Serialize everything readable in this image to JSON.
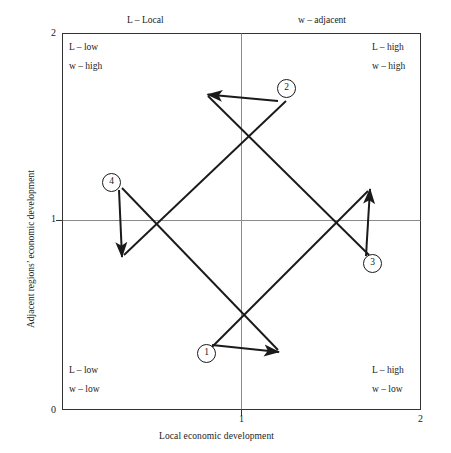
{
  "figure": {
    "axes": {
      "x_title": "Local economic development",
      "y_title": "Adjacent regions’ economic development",
      "x_ticks": [
        "0",
        "1",
        "2"
      ],
      "y_ticks": [
        "0",
        "1",
        "2"
      ],
      "x_range": [
        0,
        2
      ],
      "y_range": [
        0,
        2
      ],
      "frame_color": "#333333",
      "center_line_color": "#888888"
    },
    "top_headers": [
      {
        "label": "L – Local"
      },
      {
        "label": "w – adjacent"
      }
    ],
    "quadrant_labels": [
      {
        "position": "top-left",
        "line1": "L – low",
        "line2": "w – high"
      },
      {
        "position": "top-right",
        "line1": "L – high",
        "line2": "w – high"
      },
      {
        "position": "bottom-left",
        "line1": "L – low",
        "line2": "w – low"
      },
      {
        "position": "bottom-right",
        "line1": "L – high",
        "line2": "w – low"
      }
    ],
    "arrows": [
      {
        "id": "1",
        "label": "1",
        "direction": "down-right",
        "from": [
          0.75,
          0.4
        ],
        "to": [
          1.2,
          0.25
        ]
      },
      {
        "id": "2",
        "label": "2",
        "direction": "up-left",
        "from": [
          1.25,
          1.75
        ],
        "to": [
          0.82,
          1.63
        ]
      },
      {
        "id": "3",
        "label": "3",
        "direction": "up-right",
        "from": [
          1.6,
          0.72
        ],
        "to": [
          1.72,
          1.17
        ]
      },
      {
        "id": "4",
        "label": "4",
        "direction": "down-left",
        "from": [
          0.3,
          1.2
        ],
        "to": [
          0.25,
          0.78
        ]
      }
    ],
    "arrow_color": "#1a1a1a"
  }
}
